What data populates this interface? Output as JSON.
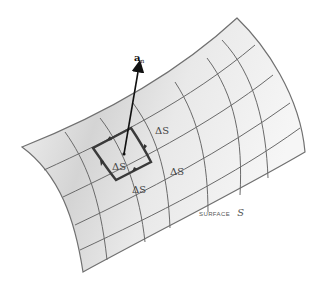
{
  "figure": {
    "type": "surface-patch-diagram",
    "surface_label": {
      "prefix": "SURFACE",
      "symbol": "S"
    },
    "normal_vector": {
      "symbol": "a",
      "subscript": "n"
    },
    "element_labels": [
      "ΔS",
      "ΔS",
      "ΔS",
      "ΔS"
    ],
    "colors": {
      "grid_line": "#6a6a6a",
      "edge": "#707070",
      "highlight_loop": "#3a3a3a",
      "vector": "#111111",
      "shade_light": "#f4f4f4",
      "shade_dark": "#cfcfcf",
      "text": "#444444"
    }
  }
}
